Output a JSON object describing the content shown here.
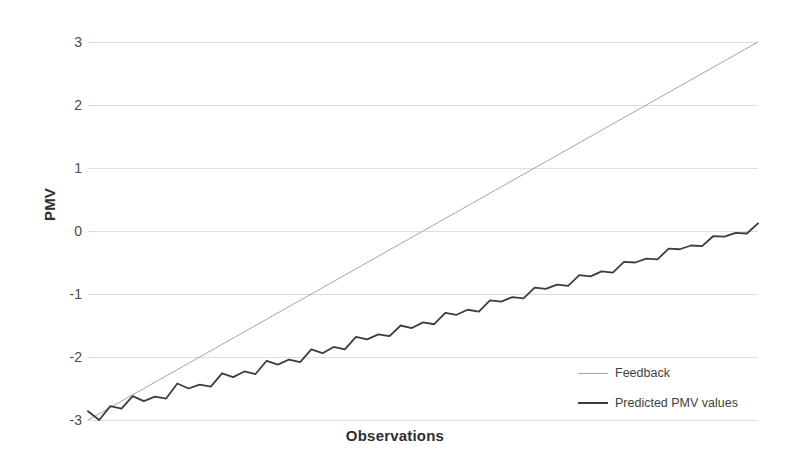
{
  "chart_data": {
    "type": "line",
    "title": "",
    "xlabel": "Observations",
    "ylabel": "PMV",
    "grid": true,
    "legend_position": "bottom-right",
    "ylim": [
      -3,
      3
    ],
    "yticks": [
      3,
      2,
      1,
      0,
      -1,
      -2,
      -3
    ],
    "ytick_labels": [
      "3",
      "2",
      "1",
      "0",
      "-1",
      "-2",
      "-3"
    ],
    "xlim": [
      0,
      60
    ],
    "xticks": [],
    "xtick_labels": [],
    "series": [
      {
        "name": "Feedback",
        "color": "#a6a6a6",
        "width": 1,
        "x": [
          0,
          60
        ],
        "values": [
          -3,
          3
        ]
      },
      {
        "name": "Predicted PMV values",
        "color": "#3d3d3d",
        "width": 1.8,
        "x": [
          0,
          1,
          2,
          3,
          4,
          5,
          6,
          7,
          8,
          9,
          10,
          11,
          12,
          13,
          14,
          15,
          16,
          17,
          18,
          19,
          20,
          21,
          22,
          23,
          24,
          25,
          26,
          27,
          28,
          29,
          30,
          31,
          32,
          33,
          34,
          35,
          36,
          37,
          38,
          39,
          40,
          41,
          42,
          43,
          44,
          45,
          46,
          47,
          48,
          49,
          50,
          51,
          52,
          53,
          54,
          55,
          56,
          57,
          58,
          59,
          60
        ],
        "values": [
          -2.86,
          -3.0,
          -2.78,
          -2.82,
          -2.62,
          -2.7,
          -2.63,
          -2.66,
          -2.42,
          -2.5,
          -2.44,
          -2.47,
          -2.26,
          -2.32,
          -2.23,
          -2.27,
          -2.06,
          -2.12,
          -2.04,
          -2.08,
          -1.88,
          -1.94,
          -1.84,
          -1.88,
          -1.68,
          -1.72,
          -1.64,
          -1.67,
          -1.5,
          -1.54,
          -1.45,
          -1.48,
          -1.3,
          -1.33,
          -1.25,
          -1.28,
          -1.1,
          -1.12,
          -1.05,
          -1.07,
          -0.9,
          -0.92,
          -0.85,
          -0.87,
          -0.7,
          -0.72,
          -0.64,
          -0.66,
          -0.49,
          -0.5,
          -0.44,
          -0.45,
          -0.28,
          -0.29,
          -0.23,
          -0.24,
          -0.08,
          -0.09,
          -0.03,
          -0.04,
          0.12
        ]
      }
    ]
  },
  "axes": {
    "y_title": "PMV",
    "x_title": "Observations",
    "y_ticks": [
      "3",
      "2",
      "1",
      "0",
      "-1",
      "-2",
      "-3"
    ]
  },
  "legend": {
    "items": [
      {
        "label": "Feedback",
        "style": "thin"
      },
      {
        "label": "Predicted PMV values",
        "style": "thick"
      }
    ]
  }
}
